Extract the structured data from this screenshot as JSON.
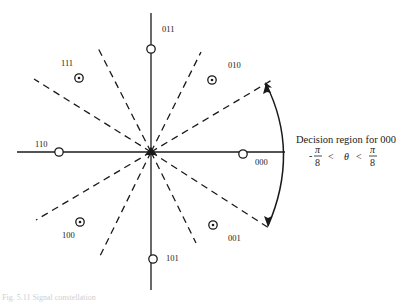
{
  "diagram": {
    "type": "8-PSK signal constellation with decision regions",
    "center": {
      "x": 151,
      "y": 152
    },
    "axes": {
      "horizontal": {
        "x1": 17,
        "x2": 285,
        "y": 152
      },
      "vertical": {
        "x": 151,
        "y1": 13,
        "y2": 290
      }
    },
    "points": [
      {
        "label": "000",
        "marker": "open-circle",
        "x": 243,
        "y": 155,
        "lx": 255,
        "ly": 165
      },
      {
        "label": "010",
        "marker": "dotted-circle",
        "x": 212,
        "y": 80,
        "lx": 228,
        "ly": 67
      },
      {
        "label": "011",
        "marker": "open-circle",
        "x": 151,
        "y": 49,
        "lx": 162,
        "ly": 31
      },
      {
        "label": "111",
        "marker": "dotted-circle",
        "x": 79,
        "y": 78,
        "lx": 61,
        "ly": 66
      },
      {
        "label": "110",
        "marker": "open-circle",
        "x": 59,
        "y": 152,
        "lx": 35,
        "ly": 147
      },
      {
        "label": "100",
        "marker": "dotted-circle",
        "x": 80,
        "y": 222,
        "lx": 62,
        "ly": 238
      },
      {
        "label": "101",
        "marker": "open-circle",
        "x": 153,
        "y": 259,
        "lx": 166,
        "ly": 261
      },
      {
        "label": "001",
        "marker": "dotted-circle",
        "x": 213,
        "y": 225,
        "lx": 228,
        "ly": 240
      }
    ],
    "boundary_angles_deg": [
      22.5,
      67.5,
      112.5,
      157.5,
      202.5,
      247.5,
      292.5,
      337.5
    ],
    "annotation": {
      "title": "Decision region for 000",
      "inequality": {
        "left": "-",
        "num1": "π",
        "den1": "8",
        "op1": "<",
        "var": "θ",
        "op2": "<",
        "num2": "π",
        "den2": "8"
      }
    },
    "arc": {
      "from": {
        "x": 266,
        "y": 83
      },
      "to": {
        "x": 268,
        "y": 226
      },
      "arrowheads": "both"
    }
  },
  "caption": "Fig. 5.11   Signal constellation"
}
